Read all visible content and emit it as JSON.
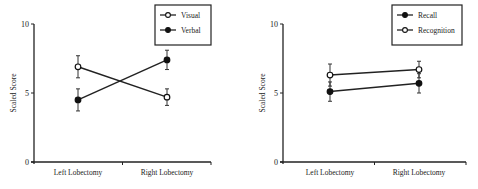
{
  "chart_data": [
    {
      "type": "line",
      "title": "",
      "xlabel": "",
      "ylabel": "Scaled Score",
      "ylim": [
        0,
        10
      ],
      "yticks": [
        "0",
        "5",
        "10"
      ],
      "categories": [
        "Left Lobectomy",
        "Right Lobectomy"
      ],
      "grid": false,
      "legend_position": "top-right",
      "series": [
        {
          "name": "Visual",
          "marker": "open-circle",
          "values": [
            6.9,
            4.7
          ],
          "error": [
            0.8,
            0.6
          ]
        },
        {
          "name": "Verbal",
          "marker": "filled-circle",
          "values": [
            4.5,
            7.4
          ],
          "error": [
            0.8,
            0.7
          ]
        }
      ]
    },
    {
      "type": "line",
      "title": "",
      "xlabel": "",
      "ylabel": "Scaled Score",
      "ylim": [
        0,
        10
      ],
      "yticks": [
        "0",
        "5",
        "10"
      ],
      "categories": [
        "Left Lobectomy",
        "Right Lobectomy"
      ],
      "grid": false,
      "legend_position": "top-right",
      "series": [
        {
          "name": "Recall",
          "marker": "filled-circle",
          "values": [
            5.1,
            5.7
          ],
          "error": [
            0.7,
            0.7
          ]
        },
        {
          "name": "Recognition",
          "marker": "open-circle",
          "values": [
            6.3,
            6.7
          ],
          "error": [
            0.8,
            0.6
          ]
        }
      ]
    }
  ]
}
